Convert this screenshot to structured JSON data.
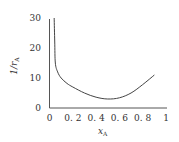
{
  "chart_data": {
    "type": "line",
    "title": "",
    "xlabel": "x_A",
    "ylabel": "1/r_A",
    "xlim": [
      0,
      1
    ],
    "ylim": [
      0,
      30
    ],
    "grid": false,
    "legend": null,
    "x_ticks": [
      "0",
      "0.2",
      "0.4",
      "0.6",
      "0.8",
      "1"
    ],
    "y_ticks": [
      "0",
      "10",
      "20",
      "30"
    ],
    "series": [
      {
        "name": "1/r_A",
        "x": [
          0.04,
          0.045,
          0.05,
          0.07,
          0.1,
          0.15,
          0.2,
          0.3,
          0.4,
          0.5,
          0.6,
          0.7,
          0.8,
          0.9
        ],
        "values": [
          30,
          22,
          15,
          12,
          10,
          8.2,
          7,
          5,
          3.6,
          3,
          3.4,
          5,
          7.8,
          11
        ]
      }
    ]
  },
  "labels": {
    "x_main": "x",
    "x_sub": "A",
    "y_main": "1/r",
    "y_sub": "A"
  },
  "colors": {
    "axis": "#555555",
    "line": "#444444",
    "text": "#333333"
  }
}
